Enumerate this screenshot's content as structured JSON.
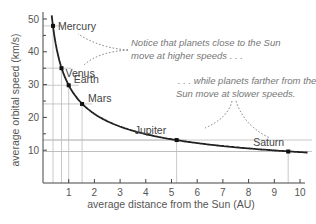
{
  "chart_data": {
    "type": "line",
    "title": "",
    "xlabel": "average distance from the Sun (AU)",
    "ylabel": "average orbital speed (km/s)",
    "xlim": [
      0,
      10.3
    ],
    "ylim": [
      0,
      52
    ],
    "x_ticks": [
      1,
      2,
      3,
      4,
      5,
      6,
      7,
      8,
      9,
      10
    ],
    "y_ticks": [
      10,
      20,
      30,
      40,
      50
    ],
    "y_minor_ticks": [
      15,
      25,
      35,
      45
    ],
    "grid": "guide lines at planet positions",
    "series": [
      {
        "name": "orbital speed curve",
        "points": [
          {
            "label": "Mercury",
            "x": 0.39,
            "y": 47.9
          },
          {
            "label": "Venus",
            "x": 0.72,
            "y": 35.0
          },
          {
            "label": "Earth",
            "x": 1.0,
            "y": 29.8
          },
          {
            "label": "Mars",
            "x": 1.52,
            "y": 24.1
          },
          {
            "label": "Jupiter",
            "x": 5.2,
            "y": 13.1
          },
          {
            "label": "Saturn",
            "x": 9.54,
            "y": 9.6
          }
        ]
      }
    ],
    "annotations": [
      {
        "text_lines": [
          "Notice that planets close to the Sun",
          "move at higher speeds . . ."
        ],
        "points_to": [
          "Mercury",
          "Venus"
        ]
      },
      {
        "text_lines": [
          ". . . while planets farther from the",
          "Sun move at slower speeds."
        ],
        "points_to": [
          "Jupiter",
          "Saturn"
        ]
      }
    ]
  }
}
